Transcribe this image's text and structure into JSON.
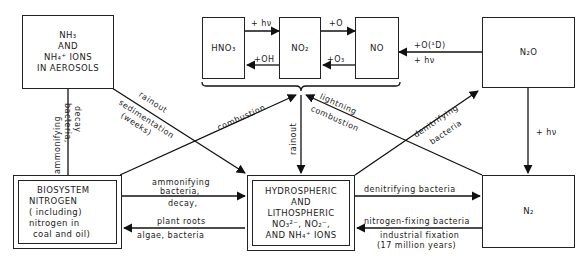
{
  "nodes": {
    "aerosols": {
      "line1": "NH₃",
      "line2": "AND",
      "line3": "NH₄⁺ IONS",
      "line4": "IN AEROSOLS"
    },
    "hno3": {
      "label": "HNO₃"
    },
    "no2": {
      "label": "NO₂"
    },
    "no": {
      "label": "NO"
    },
    "n2o": {
      "label": "N₂O"
    },
    "biosystem": {
      "line1": "BIOSYSTEM",
      "line2": "NITROGEN",
      "line3": "( including)",
      "line4": "nitrogen in",
      "line5": "coal and oil)"
    },
    "hydrospheric": {
      "line1": "HYDROSPHERIC",
      "line2": "AND",
      "line3": "LITHOSPHERIC",
      "line4": "NO₃²⁻, NO₂⁻,",
      "line5": "AND NH₄⁺  IONS"
    },
    "n2": {
      "label": "N₂"
    }
  },
  "edges": {
    "hno3_to_no2": "+ hν",
    "no2_to_hno3": "+OH",
    "no2_to_no": "+O",
    "no_to_no2": "+O₃",
    "n2o_to_no_top": "+O(¹D)",
    "n2o_to_no_bottom": "+ hν",
    "n2o_to_n2": "+ hν",
    "bio_to_aerosols_a": "ammonifying",
    "bio_to_aerosols_b": "bacteria,",
    "bio_to_aerosols_c": "decay",
    "aerosols_to_hydro_a": "rainout",
    "aerosols_to_hydro_b": "sedimentation",
    "aerosols_to_hydro_c": "(weeks)",
    "bio_to_nox": "combustion",
    "nox_to_hydro": "rainout",
    "n2_to_nox_a": "lightning",
    "n2_to_nox_b": "combustion",
    "hydro_to_n2o_a": "denitrifying",
    "hydro_to_n2o_b": "bacteria",
    "bio_to_hydro_a": "ammonifying",
    "bio_to_hydro_b": "bacteria,",
    "bio_to_hydro_c": "decay,",
    "hydro_to_bio_a": "plant roots",
    "hydro_to_bio_b": "algae, bacteria",
    "hydro_to_n2": "denitrifying bacteria",
    "n2_to_hydro_a": "nitrogen-fixing bacteria",
    "n2_to_hydro_b": "industrial fixation",
    "n2_to_hydro_c": "(17 million years)"
  }
}
